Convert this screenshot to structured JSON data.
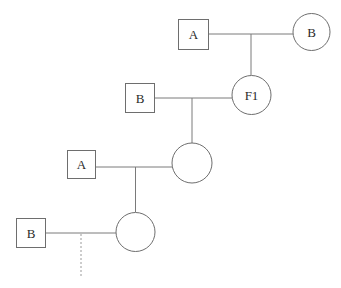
{
  "diagram": {
    "type": "pedigree-chart",
    "generations": [
      {
        "level": 1,
        "male": {
          "label": "A",
          "shape": "square"
        },
        "female": {
          "label": "B",
          "shape": "circle"
        },
        "offspring": {
          "label": "F1",
          "shape": "circle"
        }
      },
      {
        "level": 2,
        "male": {
          "label": "B",
          "shape": "square"
        },
        "female": {
          "label": "F1",
          "shape": "circle"
        },
        "offspring": {
          "label": "",
          "shape": "circle"
        }
      },
      {
        "level": 3,
        "male": {
          "label": "A",
          "shape": "square"
        },
        "female": {
          "label": "",
          "shape": "circle"
        },
        "offspring": {
          "label": "",
          "shape": "circle"
        }
      },
      {
        "level": 4,
        "male": {
          "label": "B",
          "shape": "square"
        },
        "female": {
          "label": "",
          "shape": "circle"
        },
        "offspring": {
          "label": "",
          "shape": "continuation-dotted-line"
        }
      }
    ],
    "labels": {
      "sq1": "A",
      "c1": "B",
      "c2": "F1",
      "sq2": "B",
      "sq3": "A",
      "sq4": "B"
    },
    "colors": {
      "stroke": "#6e6e6e",
      "text": "#2a2a2a",
      "background": "#ffffff"
    }
  }
}
